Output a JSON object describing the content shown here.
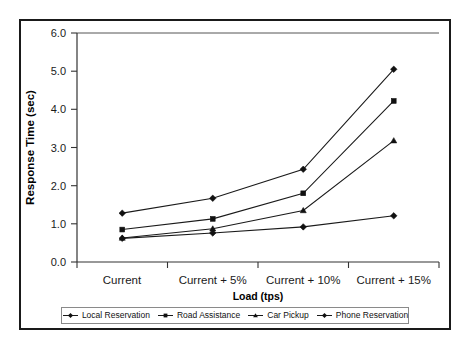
{
  "chart_data": {
    "type": "line",
    "title": "",
    "xlabel": "Load (tps)",
    "ylabel": "Response Time (sec)",
    "categories": [
      "Current",
      "Current + 5%",
      "Current + 10%",
      "Current + 15%"
    ],
    "ylim": [
      0.0,
      6.0
    ],
    "yticks": [
      "0.0",
      "1.0",
      "2.0",
      "3.0",
      "4.0",
      "5.0",
      "6.0"
    ],
    "ytick_values": [
      0.0,
      1.0,
      2.0,
      3.0,
      4.0,
      5.0,
      6.0
    ],
    "grid": false,
    "legend_position": "bottom",
    "series": [
      {
        "name": "Local Reservation",
        "marker": "diamond",
        "values": [
          1.28,
          1.67,
          2.43,
          5.05
        ]
      },
      {
        "name": "Road Assistance",
        "marker": "square",
        "values": [
          0.85,
          1.13,
          1.8,
          4.22
        ]
      },
      {
        "name": "Car Pickup",
        "marker": "triangle",
        "values": [
          0.63,
          0.87,
          1.35,
          3.18
        ]
      },
      {
        "name": "Phone Reservation",
        "marker": "diamond",
        "values": [
          0.62,
          0.76,
          0.92,
          1.21
        ]
      }
    ]
  },
  "axes": {
    "ylabel": "Response Time (sec)",
    "xlabel": "Load (tps)",
    "ytick_0": "0.0",
    "ytick_1": "1.0",
    "ytick_2": "2.0",
    "ytick_3": "3.0",
    "ytick_4": "4.0",
    "ytick_5": "5.0",
    "ytick_6": "6.0",
    "xtick_0": "Current",
    "xtick_1": "Current + 5%",
    "xtick_2": "Current + 10%",
    "xtick_3": "Current + 15%"
  },
  "legend": {
    "items": [
      {
        "label": "Local Reservation",
        "marker": "diamond"
      },
      {
        "label": "Road Assistance",
        "marker": "square"
      },
      {
        "label": "Car Pickup",
        "marker": "triangle"
      },
      {
        "label": "Phone Reservation",
        "marker": "diamond"
      }
    ]
  },
  "colors": {
    "line": "#1a1a1a",
    "marker": "#111111",
    "axis": "#333333",
    "frame": "#1a1a1a",
    "background": "#ffffff"
  }
}
